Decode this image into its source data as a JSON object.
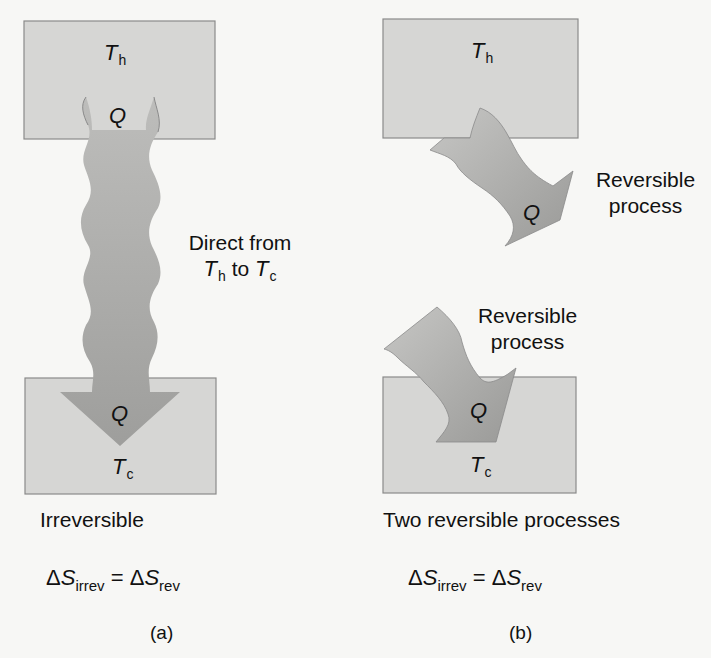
{
  "panel_a": {
    "hot_reservoir": {
      "symbol": "T",
      "subscript": "h"
    },
    "cold_reservoir": {
      "symbol": "T",
      "subscript": "c"
    },
    "heat_top": "Q",
    "heat_bottom": "Q",
    "arrow_label_line1": "Direct from",
    "arrow_label_line2_a": {
      "symbol": "T",
      "subscript": "h"
    },
    "arrow_label_line2_mid": "to",
    "arrow_label_line2_b": {
      "symbol": "T",
      "subscript": "c"
    },
    "title": "Irreversible",
    "equation": {
      "lhs_delta": "Δ",
      "lhs_symbol": "S",
      "lhs_sub": "irrev",
      "equals": "=",
      "rhs_delta": "Δ",
      "rhs_symbol": "S",
      "rhs_sub": "rev"
    },
    "caption": "(a)"
  },
  "panel_b": {
    "hot_reservoir": {
      "symbol": "T",
      "subscript": "h"
    },
    "cold_reservoir": {
      "symbol": "T",
      "subscript": "c"
    },
    "heat_top": "Q",
    "heat_bottom": "Q",
    "process_top_line1": "Reversible",
    "process_top_line2": "process",
    "process_bottom_line1": "Reversible",
    "process_bottom_line2": "process",
    "title": "Two reversible processes",
    "equation": {
      "lhs_delta": "Δ",
      "lhs_symbol": "S",
      "lhs_sub": "irrev",
      "equals": "=",
      "rhs_delta": "Δ",
      "rhs_symbol": "S",
      "rhs_sub": "rev"
    },
    "caption": "(b)"
  },
  "colors": {
    "reservoir_fill": "#d6d6d4",
    "reservoir_stroke": "#8a8a8a",
    "arrow_fill": "#a8a8a6",
    "arrow_dark": "#999997",
    "background": "#f7f7f5"
  }
}
